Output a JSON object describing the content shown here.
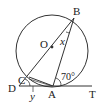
{
  "diagram": {
    "type": "geometry",
    "points": {
      "O": {
        "label": "O"
      },
      "B": {
        "label": "B"
      },
      "C": {
        "label": "C"
      },
      "D": {
        "label": "D"
      },
      "A": {
        "label": "A"
      },
      "T": {
        "label": "T"
      }
    },
    "angles": {
      "x": {
        "label": "x",
        "at": "B",
        "between": [
          "BO",
          "BA"
        ]
      },
      "y": {
        "label": "y",
        "at": "D",
        "between": [
          "DC",
          "DA"
        ]
      },
      "BAT": {
        "label": "70°",
        "value": 70
      }
    },
    "colors": {
      "stroke": "#333333",
      "background": "#ffffff"
    }
  }
}
